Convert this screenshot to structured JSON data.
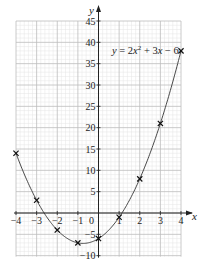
{
  "chart_data": {
    "type": "line",
    "title": "",
    "equation_label": "y = 2x² + 3x − 6",
    "xlabel": "x",
    "ylabel": "y",
    "xlim": [
      -4,
      4
    ],
    "ylim": [
      -10,
      45
    ],
    "x_ticks": [
      -4,
      -3,
      -2,
      -1,
      0,
      1,
      2,
      3,
      4
    ],
    "y_ticks": [
      -10,
      -5,
      5,
      10,
      15,
      20,
      25,
      30,
      35,
      40,
      45
    ],
    "grid": true,
    "series": [
      {
        "name": "y = 2x² + 3x − 6",
        "style": "smooth curve",
        "function": "2*x*x + 3*x - 6"
      },
      {
        "name": "plotted points",
        "style": "cross markers",
        "x": [
          -4,
          -3,
          -2,
          -1,
          0,
          1,
          2,
          3,
          4
        ],
        "y": [
          14,
          3,
          -4,
          -7,
          -6,
          -1,
          8,
          21,
          38
        ]
      }
    ]
  },
  "labels": {
    "y_axis": "y",
    "x_axis": "x",
    "origin": "0"
  },
  "colors": {
    "grid_major": "#bdbdbd",
    "grid_minor": "#e4e4e4",
    "axis": "#222222",
    "curve": "#333333",
    "marker": "#111111"
  }
}
